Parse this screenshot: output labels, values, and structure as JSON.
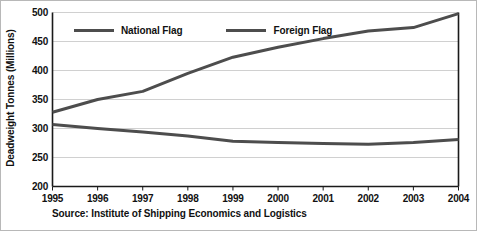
{
  "chart_data": {
    "type": "line",
    "title": "",
    "subtitle": "",
    "xlabel": "",
    "ylabel": "Deadweight Tonnes (Millions)",
    "categories": [
      "1995",
      "1996",
      "1997",
      "1998",
      "1999",
      "2000",
      "2001",
      "2002",
      "2003",
      "2004"
    ],
    "x": [
      1995,
      1996,
      1997,
      1998,
      1999,
      2000,
      2001,
      2002,
      2003,
      2004
    ],
    "series": [
      {
        "name": "National Flag",
        "color": "#4d4d4d",
        "values": [
          307,
          300,
          294,
          287,
          278,
          276,
          274,
          273,
          276,
          281
        ]
      },
      {
        "name": "Foreign Flag",
        "color": "#4d4d4d",
        "values": [
          328,
          350,
          364,
          395,
          423,
          440,
          455,
          468,
          474,
          498
        ]
      }
    ],
    "ylim": [
      200,
      500
    ],
    "yticks": [
      200,
      250,
      300,
      350,
      400,
      450,
      500
    ],
    "ytick_labels": [
      "200",
      "250",
      "300",
      "350",
      "400",
      "450",
      "500"
    ],
    "xlim": [
      1995,
      2004
    ],
    "grid": "horizontal",
    "legend_position": "top-inside",
    "annotations": [
      "Source: Institute of Shipping Economics and Logistics"
    ]
  },
  "legend": {
    "entries": [
      {
        "label": "National Flag"
      },
      {
        "label": "Foreign Flag"
      }
    ]
  },
  "source": {
    "text": "Source: Institute of Shipping Economics and Logistics"
  },
  "colors": {
    "line": "#4d4d4d",
    "grid": "#d0d0d0",
    "axis": "#1a1a1a",
    "frame": "#b8b8b8",
    "text": "#111111",
    "background": "#ffffff"
  }
}
